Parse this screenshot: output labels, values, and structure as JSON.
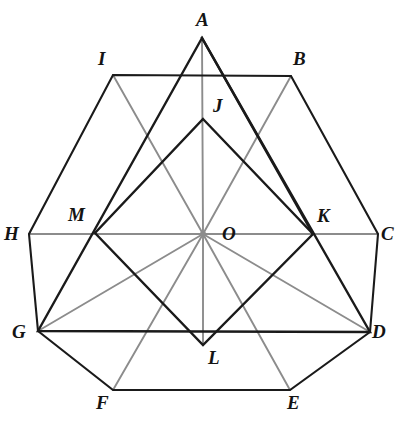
{
  "figure": {
    "canvas": {
      "width": 395,
      "height": 422
    },
    "colors": {
      "background": "#ffffff",
      "stroke_dark": "#1a1a1a",
      "stroke_gray": "#8c8c8c",
      "label_color": "#141414"
    },
    "center_label": "O",
    "points": [
      {
        "id": "A",
        "label": "A",
        "x": 202,
        "y": 38,
        "label_x": 196,
        "label_y": 10
      },
      {
        "id": "B",
        "label": "B",
        "x": 291,
        "y": 76,
        "label_x": 293,
        "label_y": 49
      },
      {
        "id": "C",
        "label": "C",
        "x": 378,
        "y": 234,
        "label_x": 381,
        "label_y": 224
      },
      {
        "id": "D",
        "label": "D",
        "x": 370,
        "y": 332,
        "label_x": 372,
        "label_y": 322
      },
      {
        "id": "E",
        "label": "E",
        "x": 290,
        "y": 390,
        "label_x": 287,
        "label_y": 393
      },
      {
        "id": "F",
        "label": "F",
        "x": 113,
        "y": 390,
        "label_x": 96,
        "label_y": 393
      },
      {
        "id": "G",
        "label": "G",
        "x": 38,
        "y": 331,
        "label_x": 12,
        "label_y": 322
      },
      {
        "id": "H",
        "label": "H",
        "x": 29,
        "y": 234,
        "label_x": 4,
        "label_y": 224
      },
      {
        "id": "I",
        "label": "I",
        "x": 113,
        "y": 75,
        "label_x": 98,
        "label_y": 49
      },
      {
        "id": "J",
        "label": "J",
        "x": 203,
        "y": 119,
        "label_x": 213,
        "label_y": 96
      },
      {
        "id": "K",
        "label": "K",
        "x": 313,
        "y": 234,
        "label_x": 317,
        "label_y": 206
      },
      {
        "id": "L",
        "label": "L",
        "x": 203,
        "y": 345,
        "label_x": 208,
        "label_y": 348
      },
      {
        "id": "M",
        "label": "M",
        "x": 95,
        "y": 233,
        "label_x": 68,
        "label_y": 205
      },
      {
        "id": "O",
        "label": "O",
        "x": 203,
        "y": 234,
        "label_x": 222,
        "label_y": 224
      }
    ],
    "shapes": [
      {
        "name": "outer-hexagon",
        "kind": "polygon",
        "vertices": [
          "I",
          "B",
          "C",
          "D",
          "E",
          "F",
          "G",
          "H"
        ],
        "stroke": "#1a1a1a",
        "stroke_width": 2.1
      },
      {
        "name": "triangle-AGD",
        "kind": "polygon",
        "vertices": [
          "A",
          "G",
          "D"
        ],
        "stroke": "#1a1a1a",
        "stroke_width": 2.4
      },
      {
        "name": "rhombus-JKLM",
        "kind": "polygon",
        "vertices": [
          "J",
          "K",
          "L",
          "M"
        ],
        "stroke": "#1a1a1a",
        "stroke_width": 2.4
      },
      {
        "name": "diagonal-A-to-K-lower",
        "kind": "polyline",
        "vertices": [
          "A",
          "K"
        ],
        "stroke": "#1a1a1a",
        "stroke_width": 2.4
      }
    ],
    "gray_rays": [
      {
        "name": "ray-O-to-A",
        "from": "O",
        "to": "A"
      },
      {
        "name": "ray-O-to-B",
        "from": "O",
        "to": "B"
      },
      {
        "name": "ray-O-to-C",
        "from": "O",
        "to": "C"
      },
      {
        "name": "ray-O-to-D",
        "from": "O",
        "to": "D"
      },
      {
        "name": "ray-O-to-E",
        "from": "O",
        "to": "E"
      },
      {
        "name": "ray-O-to-F",
        "from": "O",
        "to": "F"
      },
      {
        "name": "ray-O-to-G",
        "from": "O",
        "to": "G"
      },
      {
        "name": "ray-O-to-H",
        "from": "O",
        "to": "H"
      },
      {
        "name": "ray-O-to-I",
        "from": "O",
        "to": "I"
      },
      {
        "name": "ray-O-to-L",
        "from": "O",
        "to": "L"
      }
    ]
  }
}
